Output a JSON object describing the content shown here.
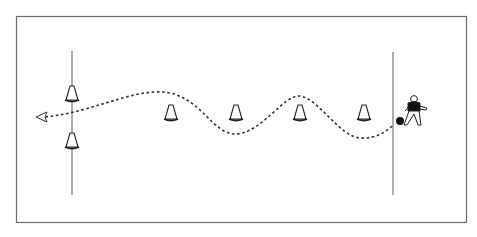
{
  "diagram": {
    "colors": {
      "field_border": "#6e6e6e",
      "line": "#7a7a7a",
      "cone_stroke": "#222222",
      "path": "#333333",
      "ball": "#111111",
      "player_shirt": "#111111"
    },
    "elements": {
      "cones_count": 6,
      "start_line": "right",
      "finish_line": "left",
      "path_style": "dashed",
      "direction": "right-to-left"
    }
  }
}
